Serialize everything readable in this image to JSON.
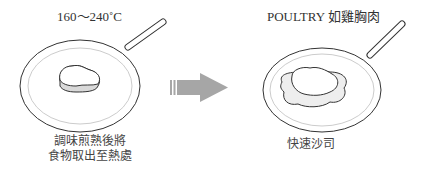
{
  "left_panel": {
    "temperature_label": "160～240˚C",
    "caption_line1": "調味煎熟後將",
    "caption_line2": "食物取出至熱處"
  },
  "right_panel": {
    "title_label": "POULTRY 如雞胸肉",
    "caption": "快速沙司"
  },
  "arrow": {
    "direction": "right",
    "color": "#a6a6a6"
  },
  "colors": {
    "outline": "#333333",
    "inner_rim": "#cccccc",
    "food_fill": "#d9d9d9",
    "sauce_fill": "#eeeeee"
  }
}
